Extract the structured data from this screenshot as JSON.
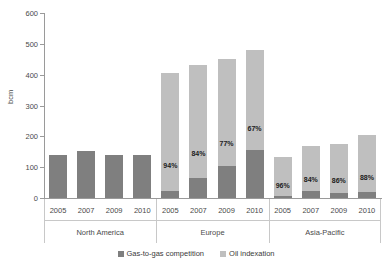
{
  "chart_data": {
    "type": "bar",
    "stacked": true,
    "title": "",
    "xlabel": "",
    "ylabel": "bcm",
    "ylim": [
      0,
      600
    ],
    "yticks": [
      0,
      100,
      200,
      300,
      400,
      500,
      600
    ],
    "grid": false,
    "legend_position": "bottom",
    "categories": [
      "2005",
      "2007",
      "2009",
      "2010",
      "2005",
      "2007",
      "2009",
      "2010",
      "2005",
      "2007",
      "2009",
      "2010"
    ],
    "groups": [
      {
        "name": "North America",
        "years": [
          "2005",
          "2007",
          "2009",
          "2010"
        ],
        "totals": [
          140,
          153,
          138,
          140
        ],
        "gas_to_gas": [
          140,
          153,
          138,
          140
        ],
        "oil_indexation": [
          0,
          0,
          0,
          0
        ],
        "oil_pct_labels": [
          "",
          "",
          "",
          ""
        ]
      },
      {
        "name": "Europe",
        "years": [
          "2005",
          "2007",
          "2009",
          "2010"
        ],
        "totals": [
          405,
          430,
          450,
          480
        ],
        "gas_to_gas": [
          24,
          66,
          103,
          155
        ],
        "oil_indexation": [
          381,
          364,
          347,
          325
        ],
        "oil_pct_labels": [
          "94%",
          "84%",
          "77%",
          "67%"
        ]
      },
      {
        "name": "Asia-Pacific",
        "years": [
          "2005",
          "2007",
          "2009",
          "2010"
        ],
        "totals": [
          133,
          170,
          175,
          203
        ],
        "gas_to_gas": [
          6,
          24,
          17,
          21
        ],
        "oil_indexation": [
          127,
          146,
          158,
          182
        ],
        "oil_pct_labels": [
          "96%",
          "84%",
          "86%",
          "88%"
        ]
      }
    ],
    "series": [
      {
        "name": "Gas-to-gas competition",
        "color": "#7f7f7f",
        "values": [
          140,
          153,
          138,
          140,
          24,
          66,
          103,
          155,
          6,
          24,
          17,
          21
        ]
      },
      {
        "name": "Oil indexation",
        "color": "#bfbfbf",
        "values": [
          0,
          0,
          0,
          0,
          381,
          364,
          347,
          325,
          127,
          146,
          158,
          182
        ]
      }
    ]
  },
  "legend": {
    "items": [
      {
        "label": "Gas-to-gas competition",
        "color": "#7f7f7f"
      },
      {
        "label": "Oil indexation",
        "color": "#bfbfbf"
      }
    ]
  }
}
